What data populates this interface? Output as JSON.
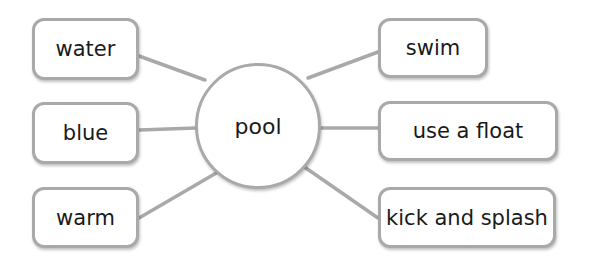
{
  "center": {
    "label": "pool"
  },
  "left_nodes": [
    {
      "label": "water"
    },
    {
      "label": "blue"
    },
    {
      "label": "warm"
    }
  ],
  "right_nodes": [
    {
      "label": "swim"
    },
    {
      "label": "use a float"
    },
    {
      "label": "kick and splash"
    }
  ],
  "colors": {
    "stroke": "#a9a9a9",
    "text": "#1a1a1a",
    "background": "#ffffff"
  }
}
